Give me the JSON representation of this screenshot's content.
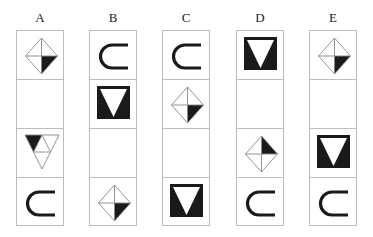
{
  "puzzle": {
    "columns": [
      {
        "label": "A",
        "cells": [
          "diamond-br",
          "empty",
          "tri-grid",
          "horseshoe"
        ]
      },
      {
        "label": "B",
        "cells": [
          "horseshoe",
          "black-square-tri",
          "empty",
          "diamond-br"
        ]
      },
      {
        "label": "C",
        "cells": [
          "horseshoe",
          "diamond-br",
          "empty",
          "black-square-tri"
        ]
      },
      {
        "label": "D",
        "cells": [
          "black-square-tri",
          "empty",
          "diamond-tr",
          "horseshoe"
        ]
      },
      {
        "label": "E",
        "cells": [
          "diamond-br",
          "empty",
          "black-square-tri",
          "horseshoe"
        ]
      }
    ]
  },
  "colors": {
    "border": "#bdbdbd",
    "fill": "#1a1a1a",
    "line": "#888888"
  }
}
